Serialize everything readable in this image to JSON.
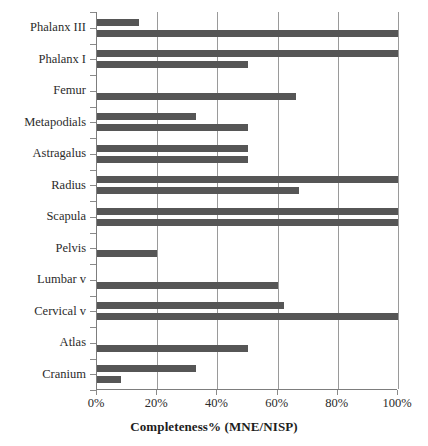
{
  "chart_data": {
    "type": "bar",
    "orientation": "horizontal",
    "title": "",
    "xlabel": "Completeness% (MNE/NISP)",
    "ylabel": "",
    "xlim": [
      0,
      100
    ],
    "xticks": [
      "0%",
      "20%",
      "40%",
      "60%",
      "80%",
      "100%"
    ],
    "xtick_values": [
      0,
      20,
      40,
      60,
      80,
      100
    ],
    "grid": "vertical",
    "legend": "none",
    "bar_color": "#565656",
    "categories": [
      "Phalanx III",
      "Phalanx I",
      "Femur",
      "Metapodials",
      "Astragalus",
      "Radius",
      "Scapula",
      "Pelvis",
      "Lumbar v",
      "Cervical v",
      "Atlas",
      "Cranium"
    ],
    "series": [
      {
        "name": "Series 1",
        "values": [
          14,
          100,
          0,
          33,
          50,
          100,
          100,
          0,
          0,
          62,
          0,
          33
        ]
      },
      {
        "name": "Series 2",
        "values": [
          100,
          50,
          66,
          50,
          50,
          67,
          100,
          20,
          60,
          100,
          50,
          8
        ]
      }
    ]
  }
}
